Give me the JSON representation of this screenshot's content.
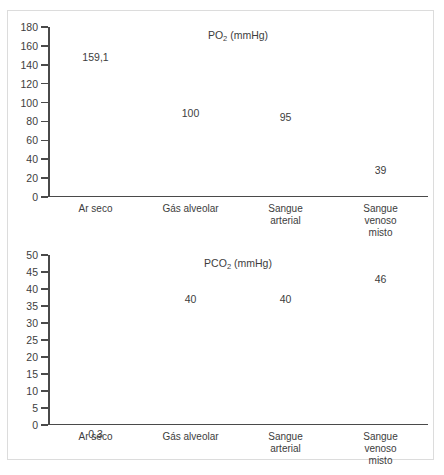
{
  "figure": {
    "caption": ""
  },
  "chart_data": [
    {
      "type": "bar",
      "id": "po2",
      "title": "PO",
      "title_sub": "2",
      "title_suffix": " (mmHg)",
      "title_full": "PO2 (mmHg)",
      "ylabel": "",
      "xlabel": "",
      "ylim": [
        0,
        180
      ],
      "ytick_step": 20,
      "yticks": [
        180,
        160,
        140,
        120,
        100,
        80,
        60,
        40,
        20,
        0
      ],
      "grid": false,
      "legend": "none",
      "categories": [
        "Ar seco",
        "Gás alveolar",
        "Sangue\narterial",
        "Sangue\nvenoso misto"
      ],
      "values": [
        159.1,
        100,
        95,
        39
      ],
      "value_labels": [
        "159,1",
        "100",
        "95",
        "39"
      ]
    },
    {
      "type": "bar",
      "id": "pco2",
      "title": "PCO",
      "title_sub": "2",
      "title_suffix": " (mmHg)",
      "title_full": "PCO2 (mmHg)",
      "ylabel": "",
      "xlabel": "",
      "ylim": [
        0,
        50
      ],
      "ytick_step": 5,
      "yticks": [
        50,
        45,
        40,
        35,
        30,
        25,
        20,
        15,
        10,
        5,
        0
      ],
      "grid": false,
      "legend": "none",
      "categories": [
        "Ar seco",
        "Gás alveolar",
        "Sangue\narterial",
        "Sangue\nvenoso misto"
      ],
      "values": [
        0.3,
        40,
        40,
        46
      ],
      "value_labels": [
        "0,3",
        "40",
        "40",
        "46"
      ]
    }
  ],
  "colors": {
    "axis": "#4a4a4a",
    "text": "#3d3d3d",
    "frame": "#dcdcdc",
    "background": "#ffffff"
  }
}
